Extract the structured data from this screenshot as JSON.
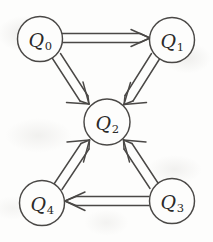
{
  "figure": {
    "kind": "directed-graph",
    "background_color": "#fdfdfc",
    "stroke_color": "#4a4846",
    "label_color": "#2b2a29",
    "edge_style": "double-line-ribbon",
    "arrowhead_style": "open-barb"
  },
  "nodes": [
    {
      "id": "Q0",
      "letter": "Q",
      "subscript": "0",
      "cx": 40,
      "cy": 39,
      "r": 22.5
    },
    {
      "id": "Q1",
      "letter": "Q",
      "subscript": "1",
      "cx": 172,
      "cy": 40,
      "r": 22.5
    },
    {
      "id": "Q2",
      "letter": "Q",
      "subscript": "2",
      "cx": 107,
      "cy": 122,
      "r": 23.0
    },
    {
      "id": "Q3",
      "letter": "Q",
      "subscript": "3",
      "cx": 172,
      "cy": 201,
      "r": 22.5
    },
    {
      "id": "Q4",
      "letter": "Q",
      "subscript": "4",
      "cx": 42,
      "cy": 203,
      "r": 22.5
    }
  ],
  "edges": [
    {
      "from": "Q0",
      "to": "Q1",
      "direction": "right"
    },
    {
      "from": "Q0",
      "to": "Q2",
      "direction": "down-right"
    },
    {
      "from": "Q1",
      "to": "Q2",
      "direction": "down-left"
    },
    {
      "from": "Q4",
      "to": "Q2",
      "direction": "up-right"
    },
    {
      "from": "Q3",
      "to": "Q2",
      "direction": "up-left"
    },
    {
      "from": "Q3",
      "to": "Q4",
      "direction": "left"
    }
  ]
}
